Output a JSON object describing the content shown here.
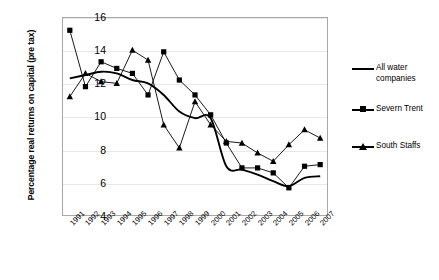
{
  "chart_data": {
    "type": "line",
    "title": "",
    "xlabel": "",
    "ylabel": "Percentage real returns on capital (pre tax)",
    "categories": [
      "1991",
      "1992",
      "1993",
      "1994",
      "1995",
      "1996",
      "1997",
      "1998",
      "1999",
      "2000",
      "2001",
      "2002",
      "2003",
      "2004",
      "2005",
      "2006",
      "2007"
    ],
    "ylim": [
      4,
      16
    ],
    "yticks": [
      4,
      6,
      8,
      10,
      12,
      14,
      16
    ],
    "grid": true,
    "legend_position": "right",
    "series": [
      {
        "name": "All water companies",
        "marker": "none",
        "color": "#000000",
        "values": [
          12.3,
          12.5,
          12.7,
          12.6,
          12.2,
          12.0,
          11.3,
          10.3,
          9.9,
          9.9,
          7.0,
          6.8,
          6.5,
          6.1,
          5.8,
          6.3,
          6.4
        ]
      },
      {
        "name": "Severn Trent",
        "marker": "square",
        "color": "#000000",
        "values": [
          15.2,
          11.8,
          13.3,
          12.9,
          12.6,
          11.3,
          13.9,
          12.2,
          11.3,
          10.1,
          8.4,
          6.9,
          6.9,
          6.6,
          5.7,
          7.0,
          7.1
        ]
      },
      {
        "name": "South Staffs",
        "marker": "triangle",
        "color": "#000000",
        "values": [
          11.2,
          12.6,
          12.1,
          12.0,
          14.0,
          13.4,
          9.5,
          8.1,
          10.9,
          9.5,
          8.5,
          8.4,
          7.8,
          7.3,
          8.3,
          9.2,
          8.7
        ]
      }
    ]
  },
  "axis": {
    "y_title": "Percentage real returns on capital (pre tax)",
    "y_tick_labels": [
      "16",
      "14",
      "12",
      "10",
      "8",
      "6",
      "4"
    ],
    "x_tick_labels": [
      "1991",
      "1992",
      "1993",
      "1994",
      "1995",
      "1996",
      "1997",
      "1998",
      "1999",
      "2000",
      "2001",
      "2002",
      "2003",
      "2004",
      "2005",
      "2006",
      "2007"
    ]
  },
  "legend": {
    "items": [
      {
        "label": "All water companies",
        "key": "plain-line"
      },
      {
        "label": "Severn Trent",
        "key": "square-marker-line"
      },
      {
        "label": "South Staffs",
        "key": "triangle-marker-line"
      }
    ]
  }
}
